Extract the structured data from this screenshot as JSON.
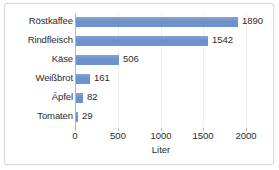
{
  "chart_data": {
    "type": "bar",
    "orientation": "horizontal",
    "title": "",
    "xlabel": "Liter",
    "ylabel": "",
    "xlim": [
      0,
      2000
    ],
    "xticks": [
      0,
      500,
      1000,
      1500,
      2000
    ],
    "grid": true,
    "legend": false,
    "bar_color": "#6e93ce",
    "categories": [
      "Röstkaffee",
      "Rindfleisch",
      "Käse",
      "Weißbrot",
      "Äpfel",
      "Tomaten"
    ],
    "values": [
      1890,
      1542,
      506,
      161,
      82,
      29
    ],
    "value_labels": [
      "1890",
      "1542",
      "506",
      "161",
      "82",
      "29"
    ],
    "tick_labels": [
      "0",
      "500",
      "1000",
      "1500",
      "2000"
    ]
  }
}
